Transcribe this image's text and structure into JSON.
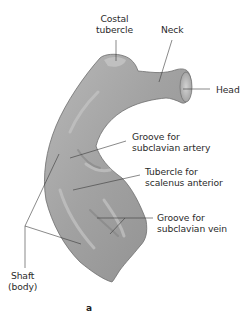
{
  "figure": {
    "panel_letter": "a",
    "labels": {
      "costal_tubercle": [
        "Costal",
        "tubercle"
      ],
      "neck": "Neck",
      "head": "Head",
      "groove_subclavian_artery": [
        "Groove for",
        "subclavian artery"
      ],
      "tubercle_scalenus_anterior": [
        "Tubercle for",
        "scalenus anterior"
      ],
      "groove_subclavian_vein": [
        "Groove for",
        "subclavian vein"
      ],
      "shaft": [
        "Shaft",
        "(body)"
      ]
    },
    "colors": {
      "bone_fill": "#9a9a9a",
      "bone_light": "#c9c9c9",
      "bone_dark": "#6e6e6e",
      "leader_line": "#3a3a3a",
      "text": "#2b2b2b"
    }
  }
}
